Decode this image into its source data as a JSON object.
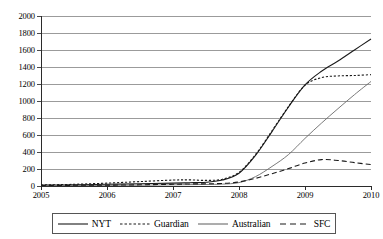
{
  "chart_data": {
    "type": "line",
    "title": "",
    "subtitle": "",
    "xlabel": "",
    "ylabel": "",
    "xlim": [
      2005,
      2010
    ],
    "ylim": [
      0,
      2000
    ],
    "grid": true,
    "legend_position": "bottom",
    "y_ticks": [
      0,
      200,
      400,
      600,
      800,
      1000,
      1200,
      1400,
      1600,
      1800,
      2000
    ],
    "x_ticks": [
      2005,
      2006,
      2007,
      2008,
      2009,
      2010
    ],
    "x_tick_labels": [
      "2005",
      "2006",
      "2007",
      "2008",
      "2009",
      "2010"
    ],
    "y_tick_labels": [
      "0",
      "200",
      "400",
      "600",
      "800",
      "1000",
      "1200",
      "1400",
      "1600",
      "1800",
      "2000"
    ],
    "x": [
      2005,
      2005.5,
      2006,
      2006.5,
      2007,
      2007.25,
      2007.5,
      2007.75,
      2008,
      2008.25,
      2008.5,
      2008.75,
      2009,
      2009.25,
      2009.5,
      2009.75,
      2010
    ],
    "series": [
      {
        "name": "NYT",
        "style": "solid",
        "color": "#1a1a1a",
        "values": [
          10,
          14,
          20,
          26,
          34,
          38,
          45,
          70,
          150,
          360,
          640,
          930,
          1190,
          1350,
          1470,
          1600,
          1730
        ]
      },
      {
        "name": "Guardian",
        "style": "dotted",
        "color": "#1a1a1a",
        "values": [
          12,
          20,
          34,
          52,
          70,
          72,
          66,
          80,
          160,
          370,
          650,
          935,
          1185,
          1275,
          1295,
          1300,
          1310
        ]
      },
      {
        "name": "Australian",
        "style": "solid",
        "color": "#6a6a6a",
        "values": [
          4,
          6,
          8,
          10,
          14,
          16,
          18,
          22,
          40,
          110,
          230,
          370,
          560,
          740,
          910,
          1075,
          1230
        ]
      },
      {
        "name": "SFC",
        "style": "dashed",
        "color": "#1a1a1a",
        "values": [
          6,
          8,
          10,
          14,
          20,
          24,
          26,
          30,
          48,
          90,
          145,
          205,
          270,
          310,
          300,
          275,
          252
        ]
      }
    ]
  },
  "legend": {
    "items": [
      {
        "label": "NYT",
        "style": "solid",
        "color": "#1a1a1a"
      },
      {
        "label": "Guardian",
        "style": "dotted",
        "color": "#1a1a1a"
      },
      {
        "label": "Australian",
        "style": "solid",
        "color": "#6a6a6a"
      },
      {
        "label": "SFC",
        "style": "dashed",
        "color": "#1a1a1a"
      }
    ]
  },
  "colors": {
    "gridline": "#9b9b9b",
    "axis": "#2b2b2b",
    "background": "#ffffff"
  }
}
